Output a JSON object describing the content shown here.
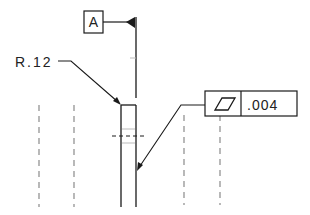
{
  "datum": {
    "label": "A"
  },
  "radius_callout": {
    "text": "R.12"
  },
  "feature_control_frame": {
    "symbol": "flatness-icon",
    "tolerance": ".004"
  },
  "colors": {
    "line": "#1a1a1a",
    "dashed": "#8a8a8a",
    "background": "#ffffff"
  }
}
